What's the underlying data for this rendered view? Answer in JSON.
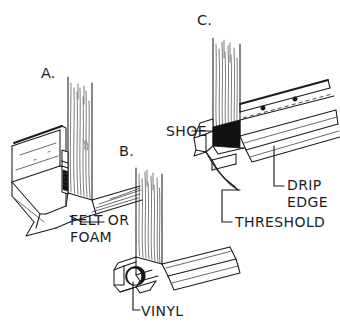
{
  "diagram": {
    "background_color": "#ffffff",
    "ink_color": "#1b1b1b",
    "figure_labels": {
      "a": "A.",
      "b": "B.",
      "c": "C."
    },
    "callouts": {
      "felt_or_foam_line1": "FELT OR",
      "felt_or_foam_line2": "FOAM",
      "vinyl": "VINYL",
      "shoe": "SHOE",
      "drip_line1": "DRIP",
      "drip_line2": "EDGE",
      "threshold": "THRESHOLD"
    }
  }
}
